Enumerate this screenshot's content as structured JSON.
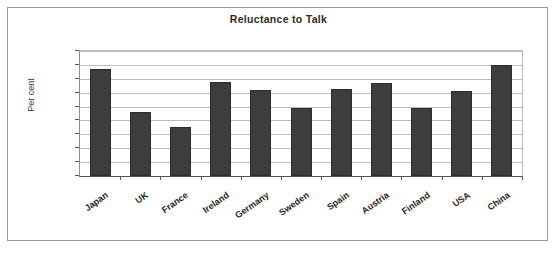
{
  "chart_data": {
    "type": "bar",
    "title": "Reluctance to Talk",
    "xlabel": "",
    "ylabel": "Per cent",
    "categories": [
      "Japan",
      "UK",
      "France",
      "Ireland",
      "Germany",
      "Sweden",
      "Spain",
      "Austria",
      "Finland",
      "USA",
      "China"
    ],
    "values": [
      77,
      46,
      35,
      68,
      62,
      49,
      63,
      67,
      49,
      61,
      80
    ],
    "ylim": [
      0,
      90
    ],
    "ytick_labels": [
      "90",
      "80",
      "70",
      "60",
      "50",
      "40",
      "30",
      "20",
      "10",
      "0"
    ],
    "ytick_values": [
      90,
      80,
      70,
      60,
      50,
      40,
      30,
      20,
      10,
      0
    ],
    "grid": true,
    "legend": false,
    "legend_position": "none",
    "series": [
      {
        "name": "Per cent",
        "values": [
          77,
          46,
          35,
          68,
          62,
          49,
          63,
          67,
          49,
          61,
          80
        ]
      }
    ]
  },
  "colors": {
    "bar_fill": "#3d3d3d",
    "bar_edge": "#2c2c2c",
    "gridline": "#bdbdbd",
    "axis": "#555555",
    "frame": "#9a9a9a",
    "title_text": "#2b2b2b",
    "background": "#ffffff"
  }
}
